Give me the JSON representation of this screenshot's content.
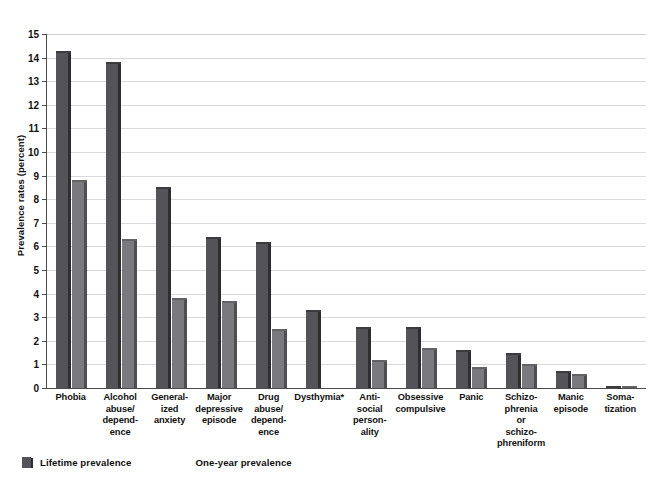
{
  "figure": {
    "title_remnant": "",
    "colors": {
      "lifetime": "#545458",
      "one_year": "#7a7a7e",
      "gridline": "#d9d9dd",
      "axis": "#4a4a4a",
      "background": "#ffffff"
    }
  },
  "legend": {
    "position": "bottom-left",
    "items": [
      {
        "label": "Lifetime prevalence",
        "color": "#545458",
        "key": "lifetime"
      },
      {
        "label": "One-year prevalence",
        "color": "#7a7a7e",
        "key": "one_year"
      }
    ]
  },
  "chart_data": {
    "type": "bar",
    "title": "",
    "xlabel": "",
    "ylabel": "Prevalence rates (percent)",
    "ylim": [
      0,
      15
    ],
    "ytick_labels": [
      "15",
      "14",
      "13",
      "12",
      "11",
      "10",
      "9",
      "8",
      "7",
      "6",
      "5",
      "4",
      "3",
      "2",
      "1",
      "0"
    ],
    "yticks": [
      15,
      14,
      13,
      12,
      11,
      10,
      9,
      8,
      7,
      6,
      5,
      4,
      3,
      2,
      1,
      0
    ],
    "grid": true,
    "legend_position": "bottom-left",
    "footnote_marker": "*",
    "categories": [
      "Phobia",
      "Alcohol\nabuse/\ndepend-\nence",
      "General-\nized\nanxiety",
      "Major\ndepressive\nepisode",
      "Drug\nabuse/\ndepend-\nence",
      "Dysthymia*",
      "Anti-\nsocial\nperson-\nality",
      "Obsessive\ncompulsive",
      "Panic",
      "Schizo-\nphrenia\nor\nschizo-\nphreniform",
      "Manic\nepisode",
      "Soma-\ntization"
    ],
    "series": [
      {
        "name": "Lifetime prevalence",
        "color": "#545458",
        "values": [
          14.3,
          13.8,
          8.5,
          6.4,
          6.2,
          3.3,
          2.6,
          2.6,
          1.6,
          1.5,
          0.7,
          0.1
        ]
      },
      {
        "name": "One-year prevalence",
        "color": "#7a7a7e",
        "values": [
          8.8,
          6.3,
          3.8,
          3.7,
          2.5,
          null,
          1.2,
          1.7,
          0.9,
          1.0,
          0.6,
          0.1
        ]
      }
    ]
  }
}
